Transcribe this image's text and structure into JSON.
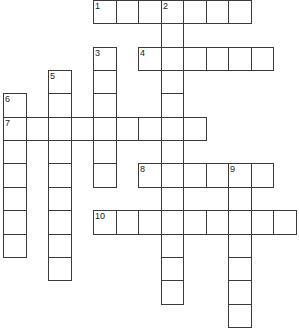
{
  "puzzle": {
    "grid": {
      "cols": 13,
      "rows": 14,
      "cell_width": 22.5,
      "cell_height": 23.35,
      "origin_x": 3,
      "origin_y": 0,
      "line_color": "#3a3a3a",
      "fill_color": "#ffffff"
    },
    "words": [
      {
        "number": "1",
        "direction": "across",
        "col": 4,
        "row": 0,
        "length": 7
      },
      {
        "number": "2",
        "direction": "down",
        "col": 7,
        "row": 0,
        "length": 13
      },
      {
        "number": "3",
        "direction": "down",
        "col": 4,
        "row": 2,
        "length": 6
      },
      {
        "number": "4",
        "direction": "across",
        "col": 6,
        "row": 2,
        "length": 6
      },
      {
        "number": "5",
        "direction": "down",
        "col": 2,
        "row": 3,
        "length": 9
      },
      {
        "number": "6",
        "direction": "down",
        "col": 0,
        "row": 4,
        "length": 7
      },
      {
        "number": "7",
        "direction": "across",
        "col": 0,
        "row": 5,
        "length": 9
      },
      {
        "number": "8",
        "direction": "across",
        "col": 6,
        "row": 7,
        "length": 6
      },
      {
        "number": "9",
        "direction": "down",
        "col": 10,
        "row": 7,
        "length": 7
      },
      {
        "number": "10",
        "direction": "across",
        "col": 4,
        "row": 9,
        "length": 9
      }
    ],
    "entries": {}
  }
}
